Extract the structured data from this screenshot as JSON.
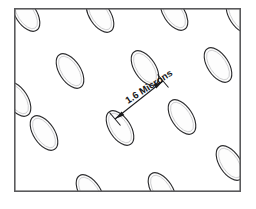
{
  "figure": {
    "background_color": "#ffffff",
    "frame": {
      "x": 14,
      "y": 8,
      "width": 227,
      "height": 184,
      "stroke_color": "#5a5a5c",
      "stroke_width": 1.6
    },
    "ellipse_style": {
      "rx": 10.5,
      "ry": 19.5,
      "rotation_deg": -33,
      "fill_color": "#fdfdfd",
      "stroke_color": "#2e2e30",
      "inner_highlight_color": "#c9c9cb"
    },
    "ellipses": [
      {
        "cx": 26,
        "cy": 14
      },
      {
        "cx": 100,
        "cy": 15
      },
      {
        "cx": 174,
        "cy": 13
      },
      {
        "cx": 240,
        "cy": 16
      },
      {
        "cx": 17,
        "cy": 99
      },
      {
        "cx": 70,
        "cy": 71
      },
      {
        "cx": 145,
        "cy": 68
      },
      {
        "cx": 218,
        "cy": 65
      },
      {
        "cx": 44,
        "cy": 133
      },
      {
        "cx": 120,
        "cy": 128
      },
      {
        "cx": 182,
        "cy": 117
      },
      {
        "cx": 230,
        "cy": 163
      },
      {
        "cx": 90,
        "cy": 192
      },
      {
        "cx": 162,
        "cy": 190
      }
    ],
    "dimension": {
      "label": "1.6 Microns",
      "label_rotation_deg": -33,
      "label_x": 128,
      "label_y": 104,
      "start_x": 115,
      "start_y": 119,
      "end_x": 163,
      "end_y": 81,
      "arrow_color": "#1d1d1f",
      "has_arrowheads_both_ends": true,
      "tick_length": 14
    }
  }
}
